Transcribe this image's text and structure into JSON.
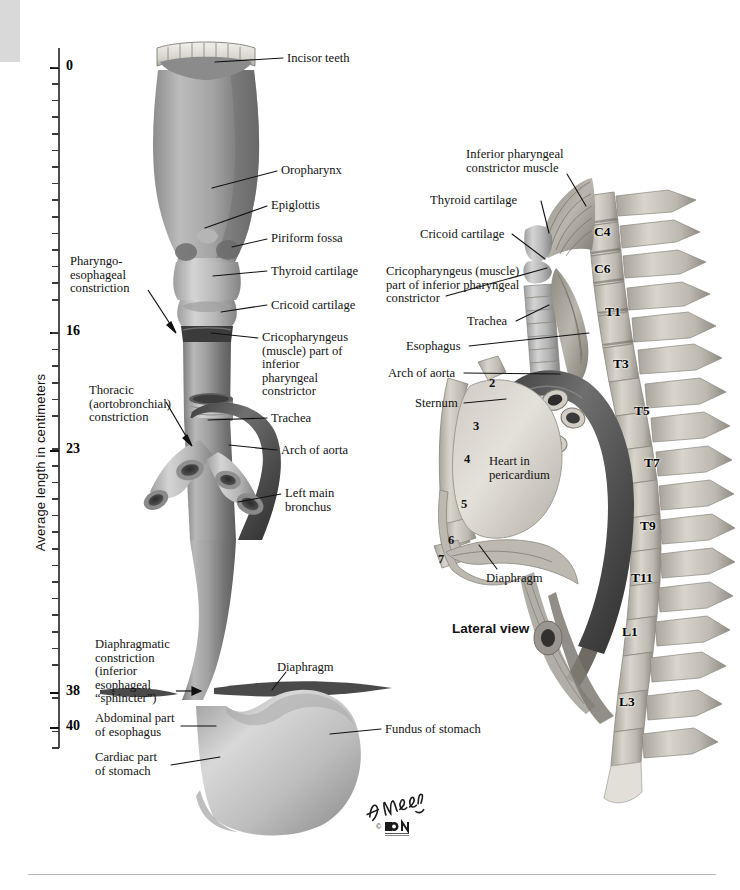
{
  "plate": {
    "axis_title": "Average length in centimeters",
    "lateral_view_caption": "Lateral view",
    "signature": "F. Netter",
    "publisher_mark": "© ICON"
  },
  "ruler": {
    "unit": "cm",
    "range": [
      0,
      42
    ],
    "labeled_values": [
      {
        "value": 0,
        "label": "0",
        "y": 67
      },
      {
        "value": 16,
        "label": "16",
        "y": 332
      },
      {
        "value": 23,
        "label": "23",
        "y": 450
      },
      {
        "value": 38,
        "label": "38",
        "y": 692
      },
      {
        "value": 40,
        "label": "40",
        "y": 727
      }
    ],
    "tick_spacing_px": 16.6,
    "tick_start_y": 50,
    "tick_count": 43
  },
  "left_panel": {
    "title": "Esophagus in situ (anterior view)",
    "labels": [
      {
        "id": "incisor-teeth",
        "text": "Incisor teeth",
        "x": 287,
        "y": 52,
        "align": "left",
        "line": [
          [
            283,
            58
          ],
          [
            215,
            62
          ]
        ]
      },
      {
        "id": "oropharynx",
        "text": "Oropharynx",
        "x": 281,
        "y": 164,
        "align": "left",
        "line": [
          [
            277,
            171
          ],
          [
            212,
            188
          ]
        ]
      },
      {
        "id": "epiglottis",
        "text": "Epiglottis",
        "x": 271,
        "y": 199,
        "align": "left",
        "line": [
          [
            267,
            206
          ],
          [
            205,
            228
          ]
        ]
      },
      {
        "id": "piriform-fossa",
        "text": "Piriform fossa",
        "x": 271,
        "y": 232,
        "align": "left",
        "line": [
          [
            267,
            239
          ],
          [
            232,
            247
          ]
        ]
      },
      {
        "id": "thyroid-cartilage",
        "text": "Thyroid cartilage",
        "x": 271,
        "y": 265,
        "align": "left",
        "line": [
          [
            267,
            271
          ],
          [
            213,
            276
          ]
        ]
      },
      {
        "id": "cricoid-cartilage",
        "text": "Cricoid cartilage",
        "x": 271,
        "y": 299,
        "align": "left",
        "line": [
          [
            267,
            305
          ],
          [
            221,
            312
          ]
        ]
      },
      {
        "id": "cricopharyngeus",
        "text": "Cricopharyngeus\n(muscle) part of\ninferior\npharyngeal\nconstrictor",
        "x": 262,
        "y": 331,
        "align": "left",
        "line": [
          [
            258,
            338
          ],
          [
            211,
            333
          ]
        ]
      },
      {
        "id": "trachea",
        "text": "Trachea",
        "x": 271,
        "y": 412,
        "align": "left",
        "line": [
          [
            267,
            418
          ],
          [
            208,
            420
          ]
        ]
      },
      {
        "id": "arch-of-aorta",
        "text": "Arch of aorta",
        "x": 281,
        "y": 444,
        "align": "left",
        "line": [
          [
            277,
            450
          ],
          [
            229,
            445
          ]
        ]
      },
      {
        "id": "left-main-bronchus",
        "text": "Left main\nbronchus",
        "x": 285,
        "y": 487,
        "align": "left",
        "line": [
          [
            281,
            494
          ],
          [
            238,
            502
          ]
        ]
      },
      {
        "id": "fundus-of-stomach",
        "text": "Fundus of stomach",
        "x": 385,
        "y": 723,
        "align": "left",
        "line": [
          [
            381,
            729
          ],
          [
            330,
            734
          ]
        ]
      },
      {
        "id": "diaphragm-left",
        "text": "Diaphragm",
        "x": 277,
        "y": 661,
        "align": "left",
        "line": [
          [
            283,
            672
          ],
          [
            270,
            690
          ]
        ]
      },
      {
        "id": "pharyngoesophageal-constriction",
        "text": "Pharyngo-\nesophageal\nconstriction",
        "x": 70,
        "y": 255,
        "align": "left",
        "arrow": [
          [
            148,
            290
          ],
          [
            176,
            332
          ]
        ]
      },
      {
        "id": "thoracic-constriction",
        "text": "Thoracic\n(aortobronchial)\nconstriction",
        "x": 89,
        "y": 384,
        "align": "left",
        "arrow": [
          [
            166,
            402
          ],
          [
            192,
            445
          ]
        ]
      },
      {
        "id": "diaphragmatic-constriction",
        "text": "Diaphragmatic\nconstriction\n(inferior\nesophageal\n“sphincter”)",
        "x": 95,
        "y": 638,
        "align": "left",
        "arrow": [
          [
            176,
            691
          ],
          [
            200,
            691
          ]
        ]
      },
      {
        "id": "abdominal-part-esophagus",
        "text": "Abdominal part\nof esophagus",
        "x": 95,
        "y": 712,
        "align": "left",
        "line": [
          [
            181,
            726
          ],
          [
            216,
            726
          ]
        ]
      },
      {
        "id": "cardiac-part-stomach",
        "text": "Cardiac part\nof stomach",
        "x": 95,
        "y": 751,
        "align": "left",
        "line": [
          [
            171,
            765
          ],
          [
            220,
            757
          ]
        ]
      }
    ]
  },
  "right_panel": {
    "caption": "Lateral view",
    "labels": [
      {
        "id": "inferior-pharyngeal-constrictor-muscle",
        "text": "Inferior pharyngeal\nconstrictor muscle",
        "x": 466,
        "y": 148,
        "align": "left",
        "line": [
          [
            567,
            174
          ],
          [
            585,
            205
          ]
        ]
      },
      {
        "id": "thyroid-cartilage-r",
        "text": "Thyroid cartilage",
        "x": 430,
        "y": 194,
        "align": "left",
        "line": [
          [
            541,
            201
          ],
          [
            549,
            233
          ]
        ]
      },
      {
        "id": "cricoid-cartilage-r",
        "text": "Cricoid cartilage",
        "x": 420,
        "y": 228,
        "align": "left",
        "line": [
          [
            512,
            234
          ],
          [
            545,
            258
          ]
        ]
      },
      {
        "id": "cricopharyngeus-r",
        "text": "Cricopharyngeus (muscle)\npart of inferior pharyngeal\nconstrictor",
        "x": 386,
        "y": 265,
        "align": "left",
        "line": [
          [
            446,
            295
          ],
          [
            546,
            268
          ]
        ]
      },
      {
        "id": "trachea-r",
        "text": "Trachea",
        "x": 467,
        "y": 315,
        "align": "left",
        "line": [
          [
            516,
            321
          ],
          [
            549,
            305
          ]
        ]
      },
      {
        "id": "esophagus-r",
        "text": "Esophagus",
        "x": 406,
        "y": 340,
        "align": "left",
        "line": [
          [
            469,
            346
          ],
          [
            589,
            332
          ]
        ]
      },
      {
        "id": "arch-of-aorta-r",
        "text": "Arch of aorta",
        "x": 388,
        "y": 367,
        "align": "left",
        "line": [
          [
            464,
            373
          ],
          [
            559,
            374
          ]
        ]
      },
      {
        "id": "sternum",
        "text": "Sternum",
        "x": 415,
        "y": 397,
        "align": "left",
        "line": [
          [
            464,
            403
          ],
          [
            504,
            398
          ]
        ]
      },
      {
        "id": "heart-in-pericardium",
        "text": "Heart in\npericardium",
        "x": 489,
        "y": 455,
        "align": "left"
      },
      {
        "id": "diaphragm-r",
        "text": "Diaphragm",
        "x": 486,
        "y": 572,
        "align": "left",
        "line": [
          [
            496,
            569
          ],
          [
            478,
            545
          ]
        ]
      }
    ],
    "vertebra_labels": [
      {
        "label": "C4",
        "x": 594,
        "y": 224
      },
      {
        "label": "C6",
        "x": 594,
        "y": 261
      },
      {
        "label": "T1",
        "x": 605,
        "y": 304
      },
      {
        "label": "T3",
        "x": 613,
        "y": 356
      },
      {
        "label": "T5",
        "x": 634,
        "y": 403
      },
      {
        "label": "T7",
        "x": 644,
        "y": 455
      },
      {
        "label": "T9",
        "x": 640,
        "y": 518
      },
      {
        "label": "T11",
        "x": 631,
        "y": 570
      },
      {
        "label": "L1",
        "x": 622,
        "y": 624
      },
      {
        "label": "L3",
        "x": 619,
        "y": 694
      }
    ],
    "rib_numbers": [
      {
        "label": "2",
        "x": 489,
        "y": 376
      },
      {
        "label": "3",
        "x": 473,
        "y": 419
      },
      {
        "label": "4",
        "x": 464,
        "y": 452
      },
      {
        "label": "5",
        "x": 461,
        "y": 497
      },
      {
        "label": "6",
        "x": 448,
        "y": 533
      },
      {
        "label": "7",
        "x": 438,
        "y": 552
      }
    ]
  },
  "colors": {
    "ink": "#131313",
    "rule": "#b9b9b9",
    "corner_block": "#d9d9d9",
    "tissue_mid": "#9b9b9b",
    "tissue_light": "#c8c8c8",
    "tissue_dark": "#5a5a5a",
    "bone": "#d2cec6",
    "background": "#ffffff"
  }
}
